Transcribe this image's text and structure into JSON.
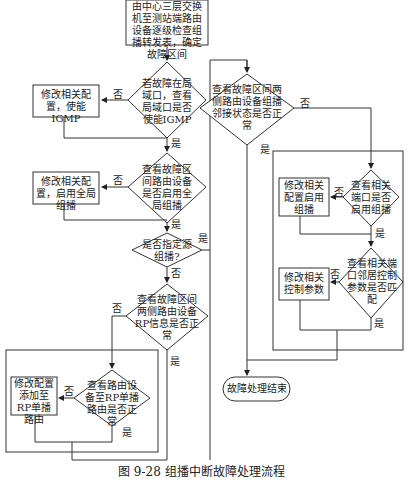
{
  "caption": "图 9-28   组播中断故障处理流程",
  "nodes": {
    "start": "由中心三层交换机至测站端路由设备逐级检查组播转发表，确定故障区间",
    "d_igmp": "若故障在局域口，查看局域口是否使能IGMP",
    "p_igmp": "修改相关配置，使能IGMP",
    "d_global": "查看故障区间路由设备是否启用全局组播",
    "p_global": "修改相关配置，启用全局组播",
    "d_ssm": "是否指定源组播?",
    "d_rp": "查看故障区间两侧路由设备RP信息是否正常",
    "d_route": "查看路由设备至RP单播路由是否正常",
    "p_route": "修改配置添加至RP单播路由",
    "d_neighbor": "查看故障区间两侧路由设备组播邻接状态是否正常",
    "d_port": "查看相关端口是否启用组播",
    "p_port": "修改相关配置启用组播",
    "d_param": "查看相关端口邻居控制参数是否匹配",
    "p_param": "修改相关控制参数",
    "end": "故障处理结束"
  },
  "labels": {
    "yes": "是",
    "no": "否"
  }
}
